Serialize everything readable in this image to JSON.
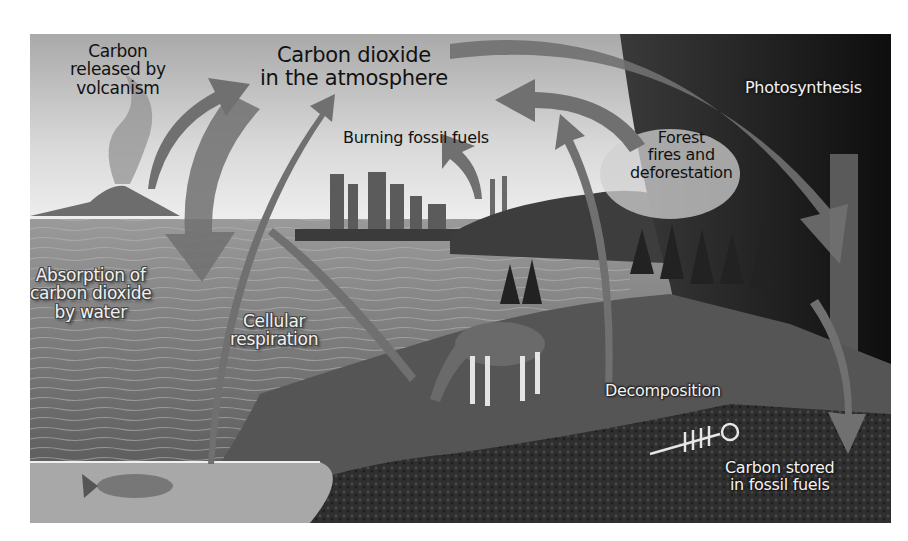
{
  "figure": {
    "labels": {
      "volcanism": [
        "Carbon",
        "released by",
        "volcanism"
      ],
      "atmosphere": [
        "Carbon dioxide",
        "in the atmosphere"
      ],
      "photosynthesis": [
        "Photosynthesis"
      ],
      "burning": [
        "Burning fossil fuels"
      ],
      "forest_fires": [
        "Forest",
        "fires and",
        "deforestation"
      ],
      "absorption": [
        "Absorption of",
        "carbon dioxide",
        "by water"
      ],
      "respiration": [
        "Cellular",
        "respiration"
      ],
      "decomposition": [
        "Decomposition"
      ],
      "stored": [
        "Carbon stored",
        "in fossil fuels"
      ]
    },
    "colors": {
      "sky": "#c9c9c9",
      "water": "#8a8a8a",
      "forest": "#1e1e1e",
      "arrow": "#6e6e6e",
      "ground": "#2b2b2b"
    }
  }
}
